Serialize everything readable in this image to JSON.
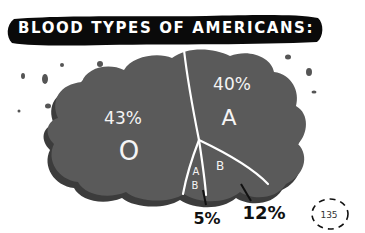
{
  "chart_data": {
    "type": "pie",
    "title": "BLOOD TYPES OF AMERICANS:",
    "style": "hand-drawn cloud-shaped pie",
    "categories": [
      "O",
      "A",
      "B",
      "AB"
    ],
    "values": [
      43,
      40,
      12,
      5
    ],
    "unit": "%",
    "labels": [
      {
        "category": "O",
        "percent_label": "43%",
        "placement": "inside"
      },
      {
        "category": "A",
        "percent_label": "40%",
        "placement": "inside"
      },
      {
        "category": "B",
        "percent_label": "12%",
        "placement": "outside-callout"
      },
      {
        "category": "AB",
        "percent_label": "5%",
        "placement": "outside-callout"
      }
    ],
    "colors": {
      "fill": "#5a5a5a",
      "shadow": "#3c3c3c",
      "dividers": "#ffffff",
      "banner": "#0a0a0a"
    }
  },
  "page_number": "135"
}
